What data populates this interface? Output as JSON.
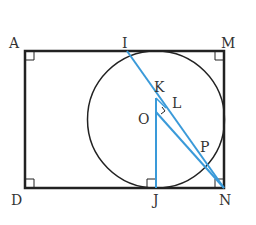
{
  "diagram": {
    "type": "geometry",
    "colors": {
      "outline": "#222222",
      "accent": "#3a9ad9",
      "label": "#333333"
    },
    "labels": {
      "A": "A",
      "I": "I",
      "M": "M",
      "D": "D",
      "J": "J",
      "N": "N",
      "K": "K",
      "L": "L",
      "O": "O",
      "P": "P"
    },
    "segments": [
      "AM",
      "MN",
      "ND",
      "DA",
      "IN",
      "OJ",
      "ON",
      "KL"
    ],
    "right_angles": [
      "A",
      "M",
      "D",
      "N",
      "J",
      "L"
    ],
    "circle": {
      "center": "O",
      "tangent_points": [
        "top side",
        "J",
        "MN side"
      ]
    }
  }
}
